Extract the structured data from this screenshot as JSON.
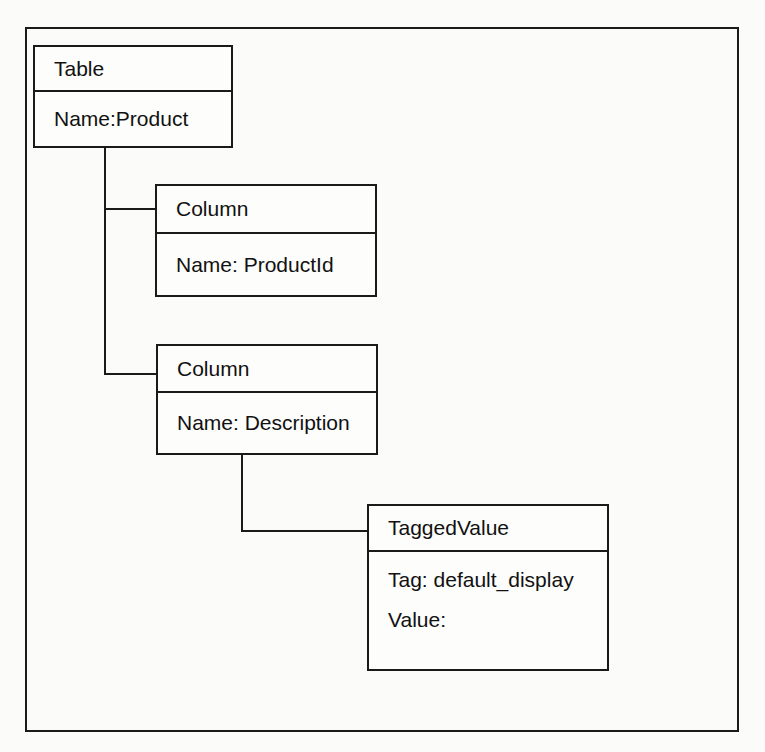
{
  "diagram": {
    "nodes": [
      {
        "id": "table",
        "title": "Table",
        "attributes": [
          "Name:Product"
        ]
      },
      {
        "id": "column1",
        "title": "Column",
        "attributes": [
          "Name: ProductId"
        ]
      },
      {
        "id": "column2",
        "title": "Column",
        "attributes": [
          "Name: Description"
        ]
      },
      {
        "id": "taggedvalue",
        "title": "TaggedValue",
        "attributes": [
          "Tag: default_display",
          "Value:"
        ]
      }
    ],
    "edges": [
      {
        "from": "table",
        "to": "column1"
      },
      {
        "from": "table",
        "to": "column2"
      },
      {
        "from": "column2",
        "to": "taggedvalue"
      }
    ]
  }
}
